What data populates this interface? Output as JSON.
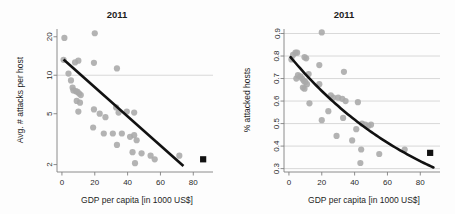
{
  "figure": {
    "background_color": "#fdfdfd",
    "point_color": "#a9a9a9",
    "fit_color": "#111111",
    "marker_color": "#111111",
    "grid_color": "#c9c9c9",
    "axis_color": "#808080"
  },
  "panels": [
    {
      "id": "left",
      "title": "2011",
      "xlabel": "GDP per capita [in 1000 US$]",
      "ylabel": "Avg. # attacks per host",
      "xticks": [
        "0",
        "20",
        "40",
        "60",
        "80"
      ],
      "yticks": [
        "2",
        "5",
        "10",
        "20"
      ]
    },
    {
      "id": "right",
      "title": "2011",
      "xlabel": "GDP per capita [in 1000 US$]",
      "ylabel": "% attacked hosts",
      "xticks": [
        "0",
        "20",
        "40",
        "60",
        "80"
      ],
      "yticks": [
        "0.3",
        "0.4",
        "0.5",
        "0.6",
        "0.7",
        "0.8",
        "0.9"
      ]
    }
  ],
  "chart_data": [
    {
      "type": "scatter",
      "panel": "left",
      "title": "2011",
      "xlabel": "GDP per capita [in 1000 US$]",
      "ylabel": "Avg. # attacks per host",
      "xlim": [
        -3,
        92
      ],
      "ylim": [
        1.75,
        23
      ],
      "yscale": "log",
      "xticks": [
        0,
        20,
        40,
        60,
        80
      ],
      "yticks": [
        2,
        5,
        10,
        20
      ],
      "grid": "horizontal-at-10-only",
      "legend": "none",
      "points": [
        {
          "x": 1.5,
          "y": 19.6
        },
        {
          "x": 20.0,
          "y": 21.3
        },
        {
          "x": 1.0,
          "y": 13.2
        },
        {
          "x": 8.0,
          "y": 12.6
        },
        {
          "x": 10.0,
          "y": 13.0
        },
        {
          "x": 19.5,
          "y": 12.5
        },
        {
          "x": 33.5,
          "y": 11.3
        },
        {
          "x": 4.0,
          "y": 10.3
        },
        {
          "x": 5.5,
          "y": 9.1
        },
        {
          "x": 6.5,
          "y": 8.0
        },
        {
          "x": 7.0,
          "y": 7.6
        },
        {
          "x": 8.5,
          "y": 7.5
        },
        {
          "x": 9.5,
          "y": 7.4
        },
        {
          "x": 10.5,
          "y": 7.2
        },
        {
          "x": 11.5,
          "y": 7.0
        },
        {
          "x": 9.0,
          "y": 6.3
        },
        {
          "x": 11.0,
          "y": 6.1
        },
        {
          "x": 10.0,
          "y": 5.2
        },
        {
          "x": 19.5,
          "y": 5.4
        },
        {
          "x": 23.0,
          "y": 5.0
        },
        {
          "x": 26.5,
          "y": 4.7
        },
        {
          "x": 33.0,
          "y": 5.6
        },
        {
          "x": 34.5,
          "y": 5.1
        },
        {
          "x": 39.5,
          "y": 5.2
        },
        {
          "x": 44.0,
          "y": 5.1
        },
        {
          "x": 19.0,
          "y": 3.9
        },
        {
          "x": 25.5,
          "y": 3.5
        },
        {
          "x": 31.0,
          "y": 3.5
        },
        {
          "x": 33.5,
          "y": 2.85
        },
        {
          "x": 36.5,
          "y": 3.5
        },
        {
          "x": 41.5,
          "y": 3.3
        },
        {
          "x": 44.0,
          "y": 3.4
        },
        {
          "x": 45.5,
          "y": 3.1
        },
        {
          "x": 43.0,
          "y": 2.5
        },
        {
          "x": 44.5,
          "y": 2.05
        },
        {
          "x": 48.5,
          "y": 2.45
        },
        {
          "x": 54.0,
          "y": 2.35
        },
        {
          "x": 56.5,
          "y": 2.2
        },
        {
          "x": 71.5,
          "y": 2.35
        }
      ],
      "fit_line": {
        "type": "log-linear",
        "x": [
          1,
          74
        ],
        "y": [
          13.3,
          1.95
        ]
      },
      "highlight_marker": {
        "x": 86,
        "y": 2.2,
        "shape": "square",
        "color": "#111111"
      }
    },
    {
      "type": "scatter",
      "panel": "right",
      "title": "2011",
      "xlabel": "GDP per capita [in 1000 US$]",
      "ylabel": "% attacked hosts",
      "xlim": [
        -3,
        92
      ],
      "ylim": [
        0.285,
        0.92
      ],
      "yscale": "linear",
      "xticks": [
        0,
        20,
        40,
        60,
        80
      ],
      "yticks": [
        0.3,
        0.4,
        0.5,
        0.6,
        0.7,
        0.8,
        0.9
      ],
      "grid": "horizontal-all-ticks",
      "legend": "none",
      "points": [
        {
          "x": 20.0,
          "y": 0.905
        },
        {
          "x": 2.5,
          "y": 0.805
        },
        {
          "x": 4.0,
          "y": 0.815
        },
        {
          "x": 5.0,
          "y": 0.815
        },
        {
          "x": 9.5,
          "y": 0.795
        },
        {
          "x": 10.5,
          "y": 0.79
        },
        {
          "x": 1.5,
          "y": 0.785
        },
        {
          "x": 18.5,
          "y": 0.76
        },
        {
          "x": 33.5,
          "y": 0.73
        },
        {
          "x": 12.0,
          "y": 0.72
        },
        {
          "x": 4.5,
          "y": 0.7
        },
        {
          "x": 5.5,
          "y": 0.715
        },
        {
          "x": 7.0,
          "y": 0.71
        },
        {
          "x": 8.0,
          "y": 0.7
        },
        {
          "x": 9.0,
          "y": 0.69
        },
        {
          "x": 10.0,
          "y": 0.685
        },
        {
          "x": 11.0,
          "y": 0.675
        },
        {
          "x": 8.5,
          "y": 0.66
        },
        {
          "x": 9.5,
          "y": 0.655
        },
        {
          "x": 18.5,
          "y": 0.675
        },
        {
          "x": 25.5,
          "y": 0.625
        },
        {
          "x": 27.0,
          "y": 0.615
        },
        {
          "x": 30.0,
          "y": 0.615
        },
        {
          "x": 32.5,
          "y": 0.61
        },
        {
          "x": 34.5,
          "y": 0.6
        },
        {
          "x": 42.0,
          "y": 0.595
        },
        {
          "x": 12.5,
          "y": 0.59
        },
        {
          "x": 24.0,
          "y": 0.555
        },
        {
          "x": 33.0,
          "y": 0.525
        },
        {
          "x": 20.0,
          "y": 0.515
        },
        {
          "x": 44.5,
          "y": 0.5
        },
        {
          "x": 46.5,
          "y": 0.495
        },
        {
          "x": 48.5,
          "y": 0.49
        },
        {
          "x": 50.0,
          "y": 0.495
        },
        {
          "x": 41.0,
          "y": 0.475
        },
        {
          "x": 29.0,
          "y": 0.445
        },
        {
          "x": 38.5,
          "y": 0.425
        },
        {
          "x": 44.0,
          "y": 0.385
        },
        {
          "x": 55.0,
          "y": 0.365
        },
        {
          "x": 70.5,
          "y": 0.385
        },
        {
          "x": 43.5,
          "y": 0.325
        }
      ],
      "fit_line": {
        "type": "exponential-decay",
        "x": [
          1,
          88
        ],
        "y": [
          0.795,
          0.305
        ]
      },
      "highlight_marker": {
        "x": 86,
        "y": 0.37,
        "shape": "square",
        "color": "#111111"
      }
    }
  ]
}
